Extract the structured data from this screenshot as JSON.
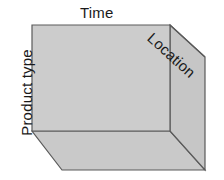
{
  "diagram": {
    "type": "3d-data-cube",
    "title_visible": false,
    "background_color": "#ffffff",
    "labels": {
      "top": "Time",
      "left": "Product type",
      "depth": "Location"
    },
    "label_rotations": {
      "top_deg": 0,
      "left_deg": -90,
      "depth_deg": 42
    },
    "colors": {
      "face_front": "#cccccc",
      "face_side": "#c6c6c6",
      "face_bottom": "#c9c9c9",
      "outline": "#5a5a5a",
      "text": "#1a1a1a"
    },
    "geometry": {
      "front_face": "32,25 170,25 170,131 32,131",
      "side_face": "170,25 205,57 205,170 170,131",
      "bottom_face": "32,131 170,131 205,170 62,170",
      "depth_edge": "170,25 205,57"
    }
  }
}
